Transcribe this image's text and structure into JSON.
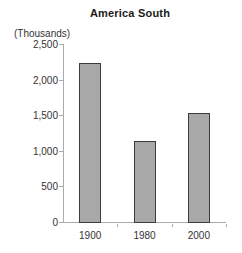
{
  "chart_data": {
    "type": "bar",
    "title": "America South",
    "ylabel": "(Thousands)",
    "xlabel": "",
    "categories": [
      "1900",
      "1980",
      "2000"
    ],
    "values": [
      2250,
      1150,
      1550
    ],
    "ylim": [
      0,
      2500
    ],
    "ytick_labels": [
      "0",
      "500",
      "1,000",
      "1,500",
      "2,000",
      "2,500"
    ],
    "grid": "off",
    "legend": "none",
    "colors": {
      "bar_fill": "#a8a8a8",
      "bar_border": "#3c3c3c",
      "axis": "#ababab",
      "text": "#333333",
      "title_text": "#1a1a1a",
      "background": "#ffffff"
    }
  }
}
